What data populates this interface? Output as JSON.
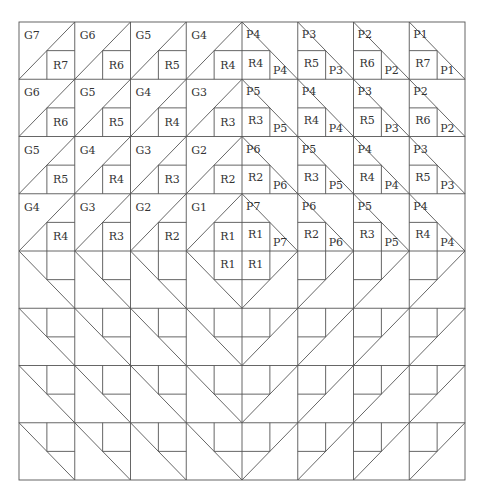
{
  "diagram": {
    "title": "",
    "grid": {
      "cols": 8,
      "rows": 8,
      "x0": 19,
      "y0": 22,
      "x1": 465,
      "y1": 480
    },
    "colors": {
      "line": "#555555",
      "text": "#333333",
      "background": "#ffffff"
    },
    "quadrants": {
      "top_left": {
        "description": "diagonal bottom-left to top-right, square in bottom-right sub-cell",
        "blocks": [
          [
            {
              "g": "G7",
              "r": "R7"
            },
            {
              "g": "G6",
              "r": "R6"
            },
            {
              "g": "G5",
              "r": "R5"
            },
            {
              "g": "G4",
              "r": "R4"
            }
          ],
          [
            {
              "g": "G6",
              "r": "R6"
            },
            {
              "g": "G5",
              "r": "R5"
            },
            {
              "g": "G4",
              "r": "R4"
            },
            {
              "g": "G3",
              "r": "R3"
            }
          ],
          [
            {
              "g": "G5",
              "r": "R5"
            },
            {
              "g": "G4",
              "r": "R4"
            },
            {
              "g": "G3",
              "r": "R3"
            },
            {
              "g": "G2",
              "r": "R2"
            }
          ],
          [
            {
              "g": "G4",
              "r": "R4"
            },
            {
              "g": "G3",
              "r": "R3"
            },
            {
              "g": "G2",
              "r": "R2"
            },
            {
              "g": "G1",
              "r": "R1"
            }
          ]
        ]
      },
      "top_right": {
        "description": "diagonal top-left to bottom-right, square in bottom-left sub-cell",
        "blocks": [
          [
            {
              "p": "P4",
              "r": "R4"
            },
            {
              "p": "P3",
              "r": "R5"
            },
            {
              "p": "P2",
              "r": "R6"
            },
            {
              "p": "P1",
              "r": "R7"
            }
          ],
          [
            {
              "p": "P5",
              "r": "R3"
            },
            {
              "p": "P4",
              "r": "R4"
            },
            {
              "p": "P3",
              "r": "R5"
            },
            {
              "p": "P2",
              "r": "R6"
            }
          ],
          [
            {
              "p": "P6",
              "r": "R2"
            },
            {
              "p": "P5",
              "r": "R3"
            },
            {
              "p": "P4",
              "r": "R4"
            },
            {
              "p": "P3",
              "r": "R5"
            }
          ],
          [
            {
              "p": "P7",
              "r": "R1"
            },
            {
              "p": "P6",
              "r": "R2"
            },
            {
              "p": "P5",
              "r": "R3"
            },
            {
              "p": "P4",
              "r": "R4"
            }
          ]
        ]
      },
      "bottom_left": {
        "description": "diagonal top-left to bottom-right, square in top-right sub-cell",
        "labels": {
          "row0_col3_square": "R1"
        }
      },
      "bottom_right": {
        "description": "diagonal bottom-left to top-right, square in top-left sub-cell",
        "labels": {
          "row0_col0_square": "R1"
        }
      }
    }
  }
}
